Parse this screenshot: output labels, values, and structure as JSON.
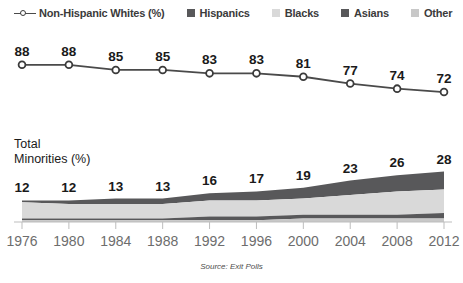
{
  "legend": {
    "items": [
      {
        "label": "Non-Hispanic Whites (%)",
        "type": "line-marker",
        "color": "#4a4a4a"
      },
      {
        "label": "Hispanics",
        "type": "swatch",
        "color": "#58585a"
      },
      {
        "label": "Blacks",
        "type": "swatch",
        "color": "#d9d9d9"
      },
      {
        "label": "Asians",
        "type": "swatch",
        "color": "#58585a"
      },
      {
        "label": "Other",
        "type": "swatch",
        "color": "#c8c8c8"
      }
    ]
  },
  "area_label": {
    "line1": "Total",
    "line2": "Minorities (%)"
  },
  "source_note": "Source: Exit Polls",
  "colors": {
    "line": "#4a4a4a",
    "marker_fill": "#ffffff",
    "marker_stroke": "#3b3b3b",
    "hispanics": "#58585a",
    "blacks": "#d9d9d9",
    "asians": "#58585a",
    "other": "#c8c8c8",
    "axis": "#bdbdbd",
    "axis_text": "#6d6d6d",
    "value_text": "#1a1a1a"
  },
  "chart_data": [
    {
      "type": "line",
      "title": "",
      "xlabel": "",
      "ylabel": "",
      "series_name": "Non-Hispanic Whites (%)",
      "categories": [
        "1976",
        "1980",
        "1984",
        "1988",
        "1992",
        "1996",
        "2000",
        "2004",
        "2008",
        "2012"
      ],
      "values": [
        88,
        88,
        85,
        85,
        83,
        83,
        81,
        77,
        74,
        72
      ],
      "ylim": [
        65,
        92
      ],
      "grid": false,
      "legend_position": "top",
      "markers": "open-circle",
      "data_labels": true
    },
    {
      "type": "area",
      "title": "Total Minorities (%)",
      "xlabel": "",
      "ylabel": "",
      "stacked": true,
      "categories": [
        "1976",
        "1980",
        "1984",
        "1988",
        "1992",
        "1996",
        "2000",
        "2004",
        "2008",
        "2012"
      ],
      "totals": [
        12,
        12,
        13,
        13,
        16,
        17,
        19,
        23,
        26,
        28
      ],
      "series": [
        {
          "name": "Hispanics",
          "values": [
            1,
            2,
            3,
            3,
            4,
            5,
            6,
            8,
            9,
            10
          ]
        },
        {
          "name": "Blacks",
          "values": [
            9,
            8,
            8,
            8,
            9,
            9,
            9,
            11,
            13,
            13
          ]
        },
        {
          "name": "Asians",
          "values": [
            1,
            1,
            1,
            1,
            2,
            2,
            2,
            2,
            2,
            3
          ]
        },
        {
          "name": "Other",
          "values": [
            1,
            1,
            1,
            1,
            1,
            1,
            2,
            2,
            2,
            2
          ]
        }
      ],
      "ylim": [
        0,
        30
      ],
      "grid": false,
      "data_labels": true
    }
  ]
}
